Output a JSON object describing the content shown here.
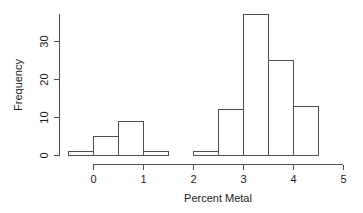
{
  "chart_data": {
    "type": "bar",
    "title": "",
    "subtitle": "",
    "xlabel": "Percent Metal",
    "ylabel": "Frequency",
    "grid": false,
    "legend": null,
    "legend_position": "none",
    "xlim": [
      -0.5,
      5.0
    ],
    "ylim": [
      0,
      37
    ],
    "bin_width": 0.5,
    "x_ticks": [
      "0",
      "1",
      "2",
      "3",
      "4",
      "5"
    ],
    "x_tick_values": [
      0,
      1,
      2,
      3,
      4,
      5
    ],
    "y_ticks": [
      "0",
      "10",
      "20",
      "30"
    ],
    "y_tick_values": [
      0,
      10,
      20,
      30
    ],
    "bins": [
      {
        "left": -0.5,
        "right": 0.0,
        "value": 1
      },
      {
        "left": 0.0,
        "right": 0.5,
        "value": 5
      },
      {
        "left": 0.5,
        "right": 1.0,
        "value": 9
      },
      {
        "left": 1.0,
        "right": 1.5,
        "value": 1
      },
      {
        "left": 1.5,
        "right": 2.0,
        "value": 0
      },
      {
        "left": 2.0,
        "right": 2.5,
        "value": 1
      },
      {
        "left": 2.5,
        "right": 3.0,
        "value": 12
      },
      {
        "left": 3.0,
        "right": 3.5,
        "value": 37
      },
      {
        "left": 3.5,
        "right": 4.0,
        "value": 25
      },
      {
        "left": 4.0,
        "right": 4.5,
        "value": 13
      }
    ],
    "categories": [
      "-0.5–0",
      "0–0.5",
      "0.5–1",
      "1–1.5",
      "1.5–2",
      "2–2.5",
      "2.5–3",
      "3–3.5",
      "3.5–4",
      "4–4.5"
    ],
    "values": [
      1,
      5,
      9,
      1,
      0,
      1,
      12,
      37,
      25,
      13
    ],
    "colors": {
      "bar_fill": "#ffffff",
      "bar_stroke": "#4d4d4d",
      "axis": "#4d4d4d",
      "text": "#1a1a1a",
      "background": "#ffffff"
    }
  }
}
